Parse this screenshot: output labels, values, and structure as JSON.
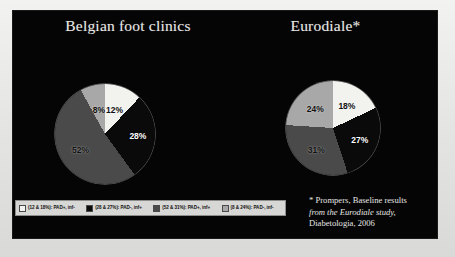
{
  "slide": {
    "background_color": "#050505",
    "text_color": "#e8e8e6"
  },
  "left_panel": {
    "title": "Belgian foot clinics"
  },
  "right_panel": {
    "title": "Eurodiale*"
  },
  "footnote": {
    "marker": "*",
    "author": "Prompers,",
    "italic_part": "Baseline results from the Eurodiale study",
    "tail": ", Diabetologia, 2006",
    "line1": "* Prompers, Baseline results",
    "line2": "from the Eurodiale study,",
    "line3": "Diabetologia, 2006"
  },
  "legend": {
    "items": [
      {
        "label": "(12 & 18%): PAD+, inf-",
        "color": "#f2f2ef"
      },
      {
        "label": "(28 & 27%): PAD-, inf+",
        "color": "#0a0a0a"
      },
      {
        "label": "(52 & 31%): PAD+, inf+",
        "color": "#4a4a4a"
      },
      {
        "label": "(8 & 24%): PAD-, inf-",
        "color": "#a8a8a8"
      }
    ]
  },
  "chart_data": [
    {
      "type": "pie",
      "title": "Belgian foot clinics",
      "categories": [
        "PAD+, inf-",
        "PAD-, inf+",
        "PAD+, inf+",
        "PAD-, inf-"
      ],
      "values": [
        12,
        28,
        52,
        8
      ],
      "labels": [
        "12%",
        "28%",
        "52%",
        "8%"
      ],
      "colors": [
        "#f2f2ef",
        "#0a0a0a",
        "#4a4a4a",
        "#a8a8a8"
      ],
      "start_angle_deg": 0,
      "direction": "clockwise",
      "unit": "%",
      "legend_position": "bottom"
    },
    {
      "type": "pie",
      "title": "Eurodiale*",
      "categories": [
        "PAD+, inf-",
        "PAD-, inf+",
        "PAD+, inf+",
        "PAD-, inf-"
      ],
      "values": [
        18,
        27,
        31,
        24
      ],
      "labels": [
        "18%",
        "27%",
        "31%",
        "24%"
      ],
      "colors": [
        "#f2f2ef",
        "#0a0a0a",
        "#4a4a4a",
        "#a8a8a8"
      ],
      "start_angle_deg": 0,
      "direction": "clockwise",
      "unit": "%",
      "legend_position": "bottom"
    }
  ]
}
